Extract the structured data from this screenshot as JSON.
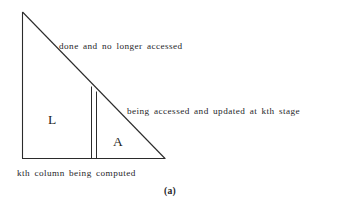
{
  "figure": {
    "caption": "(a)",
    "background_color": "#ffffff",
    "line_color": "#2b2b2b",
    "text_color": "#26262a"
  },
  "diagram": {
    "type": "annotated-geometry",
    "shape": {
      "name": "right-triangle",
      "apex": {
        "x": 22,
        "y": 12
      },
      "bottom_left": {
        "x": 22,
        "y": 158
      },
      "bottom_right": {
        "x": 165,
        "y": 158
      }
    },
    "column_marker": {
      "name": "kth-column",
      "line_1_x": 91,
      "line_2_x": 96,
      "top_y": 86,
      "bottom_y": 158
    }
  },
  "regions": [
    {
      "id": "region-l",
      "letter": "L",
      "meaning": "completed lower-triangular factor"
    },
    {
      "id": "region-a",
      "letter": "A",
      "meaning": "remaining active submatrix"
    }
  ],
  "annotations": [
    {
      "id": "done",
      "text": "done and no longer accessed"
    },
    {
      "id": "accessed",
      "text": "being accessed and updated at kth stage"
    },
    {
      "id": "kth-column",
      "text": "kth column being computed"
    }
  ]
}
